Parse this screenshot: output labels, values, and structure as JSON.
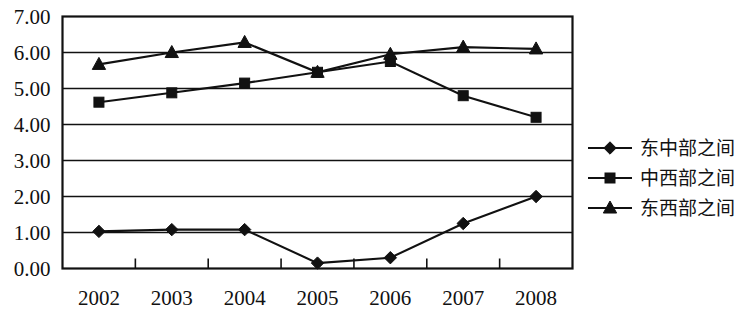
{
  "chart_data": {
    "type": "line",
    "title": "",
    "subtitle": "",
    "xlabel": "",
    "ylabel": "",
    "categories": [
      "2002",
      "2003",
      "2004",
      "2005",
      "2006",
      "2007",
      "2008"
    ],
    "ylim": [
      0.0,
      7.0
    ],
    "y_ticks": [
      0.0,
      1.0,
      2.0,
      3.0,
      4.0,
      5.0,
      6.0,
      7.0
    ],
    "y_tick_labels": [
      "0.00",
      "1.00",
      "2.00",
      "3.00",
      "4.00",
      "5.00",
      "6.00",
      "7.00"
    ],
    "x_tick_labels": [
      "2002",
      "2003",
      "2004",
      "2005",
      "2006",
      "2007",
      "2008"
    ],
    "grid": "horizontal",
    "legend_position": "right",
    "plot_background": "#ffffff",
    "line_color": "#111111",
    "series": [
      {
        "name": "东中部之间",
        "marker": "diamond",
        "color": "#111111",
        "values": [
          1.03,
          1.08,
          1.08,
          0.15,
          0.3,
          1.25,
          2.0
        ]
      },
      {
        "name": "中西部之间",
        "marker": "square",
        "color": "#111111",
        "values": [
          4.62,
          4.88,
          5.15,
          5.45,
          5.75,
          4.8,
          4.2
        ]
      },
      {
        "name": "东西部之间",
        "marker": "triangle",
        "color": "#111111",
        "values": [
          5.67,
          6.0,
          6.28,
          5.45,
          5.95,
          6.15,
          6.1
        ]
      }
    ]
  },
  "legend": {
    "items": [
      {
        "label": "东中部之间",
        "marker": "diamond"
      },
      {
        "label": "中西部之间",
        "marker": "square"
      },
      {
        "label": "东西部之间",
        "marker": "triangle"
      }
    ]
  }
}
